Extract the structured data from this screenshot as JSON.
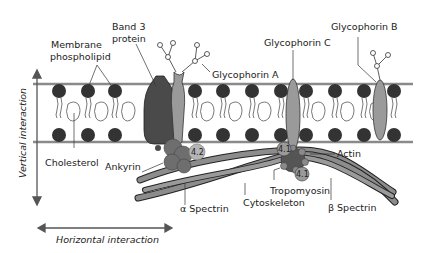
{
  "labels": {
    "membrane_phospholipid_1": "Membrane",
    "membrane_phospholipid_2": "phospholipid",
    "band3_1": "Band 3",
    "band3_2": "protein",
    "glycophorin_a": "Glycophorin A",
    "glycophorin_b": "Glycophorin B",
    "glycophorin_c": "Glycophorin C",
    "cholesterol": "Cholesterol",
    "ankyrin": "Ankyrin",
    "protein_4_2": "4.2",
    "protein_4_1a": "4.1",
    "protein_4_1b": "4.1",
    "actin": "Actin",
    "tropomyosin": "Tropomyosin",
    "alpha_spectrin": "α Spectrin",
    "beta_spectrin": "β Spectrin",
    "cytoskeleton": "Cytoskeleton",
    "vertical_interaction": "Vertical interaction",
    "horizontal_interaction": "Horizontal interaction"
  },
  "colors": {
    "membrane_line": "#8a8a8a",
    "lipid_head": "#333333",
    "band3": "#4a4a4a",
    "glycophorin": "#9a9a9a",
    "ankyrin": "#6e6e6e",
    "spectrin": "#8c8c8c",
    "actin": "#555555"
  }
}
